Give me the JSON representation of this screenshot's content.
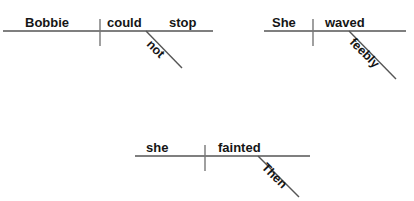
{
  "canvas": {
    "width": 414,
    "height": 201,
    "background": "#ffffff",
    "line_color": "#555555",
    "text_color": "#151515"
  },
  "diagrams": [
    {
      "id": "diagram-1",
      "sentence": "Bobbie could not stop",
      "subject": "Bobbie",
      "predicate": "could  stop",
      "verb_words": [
        "could",
        "stop"
      ],
      "modifier": "not",
      "modifier_type": "adverb",
      "baseline": {
        "x1": 3,
        "y1": 31,
        "x2": 213,
        "y2": 31
      },
      "divider": {
        "x": 100,
        "y1": 19,
        "y2": 46
      },
      "slant": {
        "x1": 146,
        "y1": 31,
        "x2": 182,
        "y2": 68
      }
    },
    {
      "id": "diagram-2",
      "sentence": "She waved feebly",
      "subject": "She",
      "predicate": "waved",
      "verb_words": [
        "waved"
      ],
      "modifier": "feebly",
      "modifier_type": "adverb",
      "baseline": {
        "x1": 6,
        "y1": 31,
        "x2": 148,
        "y2": 31
      },
      "divider": {
        "x": 55,
        "y1": 19,
        "y2": 46
      },
      "slant": {
        "x1": 91,
        "y1": 31,
        "x2": 138,
        "y2": 79
      }
    },
    {
      "id": "diagram-3",
      "sentence": "Then she fainted",
      "subject": "she",
      "predicate": "fainted",
      "verb_words": [
        "fainted"
      ],
      "modifier": "Then",
      "modifier_type": "adverb",
      "baseline": {
        "x1": 5,
        "y1": 31,
        "x2": 180,
        "y2": 31
      },
      "divider": {
        "x": 75,
        "y1": 20,
        "y2": 46
      },
      "slant": {
        "x1": 128,
        "y1": 31,
        "x2": 169,
        "y2": 72
      }
    }
  ]
}
